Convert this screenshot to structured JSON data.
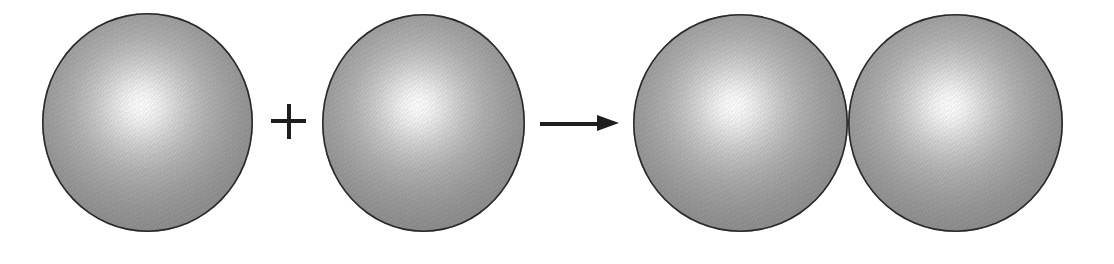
{
  "figure": {
    "background_color": "#ffffff",
    "caption": ""
  },
  "palette": {
    "sphere_highlight": "#ffffff",
    "sphere_body": "#a5a5a5",
    "sphere_edge_fill": "#8a8a8a",
    "sphere_outline": "#2b2b2b",
    "operator_color": "#1e1e1e",
    "background": "#ffffff"
  },
  "reactants": [
    {
      "id": "sphere-reactant-1",
      "label": "sphere",
      "alt": "Shaded sphere with upper-left highlight",
      "x": 42,
      "y": 13,
      "width": 211,
      "height": 219
    },
    {
      "id": "sphere-reactant-2",
      "label": "sphere",
      "alt": "Shaded sphere with upper-left highlight",
      "x": 322,
      "y": 14,
      "width": 203,
      "height": 218
    }
  ],
  "operators": {
    "plus": {
      "glyph": "+",
      "name": "plus-sign",
      "x": 271,
      "y": 104,
      "size": 35
    },
    "arrow": {
      "glyph": "→",
      "name": "rightwards-arrow",
      "direction": "right",
      "x": 540,
      "y": 113,
      "length": 80
    }
  },
  "products": [
    {
      "id": "sphere-product-1",
      "label": "sphere",
      "alt": "Left sphere of the touching pair",
      "x": 633,
      "y": 14,
      "width": 215,
      "height": 218
    },
    {
      "id": "sphere-product-2",
      "label": "sphere",
      "alt": "Right sphere of the touching pair",
      "x": 848,
      "y": 14,
      "width": 215,
      "height": 218
    }
  ]
}
